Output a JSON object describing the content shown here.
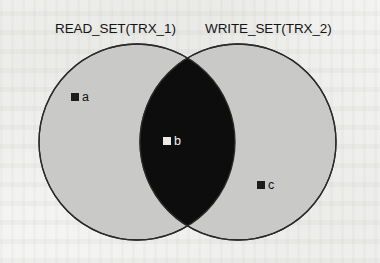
{
  "figure": {
    "type": "venn-diagram",
    "sets": [
      {
        "id": "read-set",
        "label": "READ_SET(TRX_1)"
      },
      {
        "id": "write-set",
        "label": "WRITE_SET(TRX_2)"
      }
    ],
    "elements": [
      {
        "id": "a",
        "label": "a",
        "region": "read-set-only",
        "marker": "dark-square"
      },
      {
        "id": "b",
        "label": "b",
        "region": "intersection",
        "marker": "light-square"
      },
      {
        "id": "c",
        "label": "c",
        "region": "write-set-only",
        "marker": "dark-square"
      }
    ],
    "colors": {
      "background": "#f3f3f1",
      "circle_fill": "#c9c9c7",
      "circle_stroke": "#2a2a2a",
      "intersection_fill": "#0d0d0d",
      "label_text": "#141414",
      "dark_marker": "#1c1c1c",
      "light_marker": "#eceae4"
    },
    "geometry": {
      "left_circle": {
        "cx": 137,
        "cy": 142,
        "r": 98
      },
      "right_circle": {
        "cx": 238,
        "cy": 142,
        "r": 98
      }
    }
  }
}
